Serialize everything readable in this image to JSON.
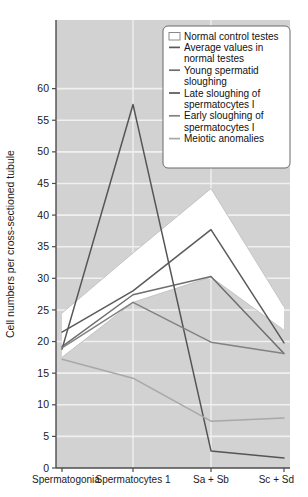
{
  "chart_data": {
    "type": "line",
    "title": "",
    "subtitle": "",
    "xlabel": "",
    "ylabel": "Cell numbers per cross-sectioned tubule",
    "categories": [
      "Spermatogonia",
      "Spermatocytes 1",
      "Sa + Sb",
      "Sc + Sd"
    ],
    "ylim": [
      0,
      65
    ],
    "yticks": [
      0,
      5,
      10,
      15,
      20,
      25,
      30,
      35,
      40,
      45,
      50,
      55,
      60
    ],
    "ytick_labels": [
      "0",
      "5",
      "10",
      "15",
      "20",
      "25",
      "30",
      "35",
      "40",
      "45",
      "50",
      "55",
      "60"
    ],
    "grid": true,
    "grid_color": "#ffffff",
    "plot_background": "#d2d2d2",
    "legend_position": "top-right",
    "band": {
      "name": "Normal control testes",
      "kind": "range-band",
      "fill": "#ffffff",
      "upper": [
        24.5,
        34.0,
        44.2,
        25.5
      ],
      "lower": [
        17.5,
        26.2,
        30.2,
        21.8
      ]
    },
    "series": [
      {
        "name": "Average values in normal testes",
        "color": "#5a5a5a",
        "values": [
          21.5,
          28.0,
          37.7,
          19.8
        ]
      },
      {
        "name": "Young spermatid sloughing",
        "color": "#6e6e6e",
        "values": [
          19.2,
          27.4,
          30.3,
          18.1
        ]
      },
      {
        "name": "Late sloughing of spermatocytes I",
        "color": "#555555",
        "values": [
          18.8,
          57.5,
          2.7,
          1.6
        ]
      },
      {
        "name": "Early sloughing of spermatocytes I",
        "color": "#828282",
        "values": [
          19.0,
          26.2,
          19.9,
          18.1
        ]
      },
      {
        "name": "Meiotic anomalies",
        "color": "#a8a8a8",
        "values": [
          17.2,
          14.2,
          7.4,
          7.9
        ]
      }
    ]
  },
  "legend": {
    "items": [
      {
        "label": "Normal control testes",
        "swatch": "box",
        "color": "#ffffff"
      },
      {
        "label": "Average values in normal testes",
        "swatch": "line",
        "color": "#5a5a5a"
      },
      {
        "label": "Young spermatid sloughing",
        "swatch": "line",
        "color": "#6e6e6e"
      },
      {
        "label": "Late sloughing of spermatocytes I",
        "swatch": "line",
        "color": "#555555"
      },
      {
        "label": "Early sloughing of spermatocytes I",
        "swatch": "line",
        "color": "#828282"
      },
      {
        "label": "Meiotic anomalies",
        "swatch": "line",
        "color": "#a8a8a8"
      }
    ],
    "lines": [
      [
        "Normal control testes"
      ],
      [
        "Average values in",
        "normal testes"
      ],
      [
        "Young spermatid",
        "sloughing"
      ],
      [
        "Late sloughing of",
        "spermatocytes I"
      ],
      [
        "Early sloughing of",
        "spermatocytes I"
      ],
      [
        "Meiotic anomalies"
      ]
    ]
  },
  "axes": {
    "y_title": "Cell numbers per cross-sectioned tubule",
    "y_ticks": [
      "60",
      "55",
      "50",
      "45",
      "40",
      "35",
      "30",
      "25",
      "20",
      "15",
      "10",
      "5",
      "0"
    ],
    "x_ticks": [
      "Spermatogonia",
      "Spermatocytes 1",
      "Sa + Sb",
      "Sc + Sd"
    ]
  },
  "colors": {
    "plot_bg": "#d2d2d2",
    "band_fill": "#ffffff",
    "grid": "#f2f2f2",
    "axis": "#4d4d4d",
    "text": "#1a1a1a",
    "legend_bg": "#ffffff",
    "legend_border": "#6b6b6b"
  }
}
